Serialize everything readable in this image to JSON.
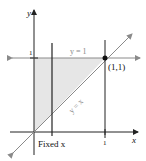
{
  "diagram": {
    "axes": {
      "x_label": "x",
      "y_label": "y"
    },
    "ticks": {
      "x_one": "1",
      "y_one": "1"
    },
    "lines": {
      "horizontal": "y = 1",
      "diagonal": "y = x",
      "vertical_label": "Fixed x"
    },
    "point": {
      "label": "(1,1)"
    },
    "colors": {
      "axis": "#222222",
      "guide": "#8a8a8a",
      "shade": "#e6e6e6",
      "text_gray": "#8a8a8a",
      "text_dark": "#111111"
    }
  }
}
